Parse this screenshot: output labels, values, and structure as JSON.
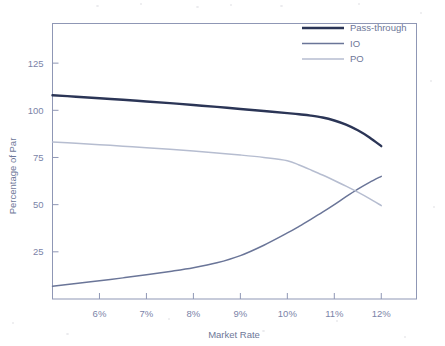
{
  "figure": {
    "name": "percentage-of-par-vs-market-rate-chart",
    "background_color": "#ffffff",
    "plot_border_color": "#8f97b5"
  },
  "axes": {
    "x": {
      "title": "Market Rate",
      "tick_labels": [
        "6%",
        "7%",
        "8%",
        "9%",
        "10%",
        "11%",
        "12%"
      ],
      "tick_values": [
        6,
        7,
        8,
        9,
        10,
        11,
        12
      ],
      "range": [
        5.0,
        12.75
      ]
    },
    "y": {
      "title": "Percentage of Par",
      "tick_labels": [
        "25",
        "50",
        "75",
        "100",
        "125"
      ],
      "tick_values": [
        25,
        50,
        75,
        100,
        125
      ],
      "range": [
        0,
        146
      ]
    }
  },
  "legend": {
    "position": "top-right",
    "entries": [
      {
        "label": "Pass-through",
        "color": "#2b3556",
        "width": 2.4
      },
      {
        "label": "IO",
        "color": "#6a7598",
        "width": 1.5
      },
      {
        "label": "PO",
        "color": "#b6bdd0",
        "width": 1.5
      }
    ]
  },
  "chart_data": {
    "type": "line",
    "title": "",
    "subtitle": "",
    "xlabel": "Market Rate",
    "ylabel": "Percentage of Par",
    "xlim": [
      5.0,
      12.75
    ],
    "ylim": [
      0,
      146
    ],
    "xticks": [
      6,
      7,
      8,
      9,
      10,
      11,
      12
    ],
    "xticklabels": [
      "6%",
      "7%",
      "8%",
      "9%",
      "10%",
      "11%",
      "12%"
    ],
    "yticks": [
      25,
      50,
      75,
      100,
      125
    ],
    "yticklabels": [
      "25",
      "50",
      "75",
      "100",
      "125"
    ],
    "grid": false,
    "legend_position": "top-right",
    "x": [
      5.0,
      5.5,
      6.0,
      6.5,
      7.0,
      7.5,
      8.0,
      8.5,
      9.0,
      9.5,
      10.0,
      10.25,
      10.5,
      10.75,
      11.0,
      11.25,
      11.5,
      11.75,
      12.0
    ],
    "series": [
      {
        "name": "Pass-through",
        "color": "#2b3556",
        "values": [
          108.0,
          107.2,
          106.4,
          105.6,
          104.7,
          103.8,
          102.8,
          101.8,
          100.7,
          99.6,
          98.5,
          97.9,
          97.2,
          96.2,
          94.6,
          92.4,
          89.4,
          85.6,
          81.0
        ]
      },
      {
        "name": "IO",
        "color": "#6a7598",
        "values": [
          6.8,
          8.2,
          9.7,
          11.2,
          12.8,
          14.6,
          16.6,
          19.2,
          23.0,
          28.5,
          35.0,
          38.5,
          42.2,
          46.0,
          50.0,
          54.2,
          58.2,
          61.8,
          65.0
        ]
      },
      {
        "name": "PO",
        "color": "#b6bdd0",
        "values": [
          83.2,
          82.5,
          81.8,
          81.0,
          80.2,
          79.3,
          78.4,
          77.4,
          76.3,
          75.0,
          73.3,
          71.0,
          68.4,
          65.7,
          62.8,
          59.8,
          56.6,
          53.2,
          49.5
        ]
      }
    ]
  }
}
